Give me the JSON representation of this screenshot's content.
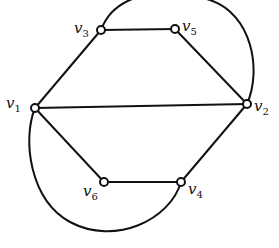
{
  "diagram": {
    "type": "graph",
    "nodes": [
      {
        "id": "v1",
        "label": "v",
        "sub": "1",
        "x": 35,
        "y": 108
      },
      {
        "id": "v2",
        "label": "v",
        "sub": "2",
        "x": 247,
        "y": 104
      },
      {
        "id": "v3",
        "label": "v",
        "sub": "3",
        "x": 101,
        "y": 30
      },
      {
        "id": "v4",
        "label": "v",
        "sub": "4",
        "x": 181,
        "y": 182
      },
      {
        "id": "v5",
        "label": "v",
        "sub": "5",
        "x": 175,
        "y": 29
      },
      {
        "id": "v6",
        "label": "v",
        "sub": "6",
        "x": 104,
        "y": 182
      }
    ],
    "edges": [
      {
        "from": "v1",
        "to": "v3",
        "shape": "straight"
      },
      {
        "from": "v3",
        "to": "v5",
        "shape": "straight"
      },
      {
        "from": "v5",
        "to": "v2",
        "shape": "straight"
      },
      {
        "from": "v1",
        "to": "v2",
        "shape": "straight"
      },
      {
        "from": "v1",
        "to": "v6",
        "shape": "straight"
      },
      {
        "from": "v6",
        "to": "v4",
        "shape": "straight"
      },
      {
        "from": "v4",
        "to": "v2",
        "shape": "straight"
      },
      {
        "from": "v3",
        "to": "v2",
        "shape": "arc-above"
      },
      {
        "from": "v1",
        "to": "v4",
        "shape": "arc-below"
      }
    ]
  }
}
